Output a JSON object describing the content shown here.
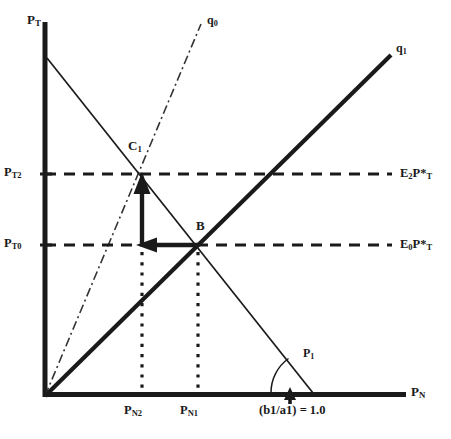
{
  "figure": {
    "type": "economics-diagram",
    "axes": {
      "y_axis_label": "P",
      "y_axis_sub": "T",
      "x_axis_label": "P",
      "x_axis_sub": "N"
    },
    "y_ticks": [
      {
        "label": "P",
        "sub": "T2",
        "y": 174
      },
      {
        "label": "P",
        "sub": "T0",
        "y": 245
      }
    ],
    "x_ticks": [
      {
        "label": "P",
        "sub": "N2",
        "x": 142
      },
      {
        "label": "P",
        "sub": "N1",
        "x": 198
      }
    ],
    "right_labels": [
      {
        "prefix": "E",
        "sub1": "2",
        "mid": "P*",
        "sub2": "T",
        "y": 174
      },
      {
        "prefix": "E",
        "sub1": "0",
        "mid": "P*",
        "sub2": "T",
        "y": 245
      }
    ],
    "curves": [
      {
        "name": "q0",
        "label": "q",
        "sub": "0",
        "style": "dash-dot"
      },
      {
        "name": "q1",
        "label": "q",
        "sub": "1",
        "style": "solid-thick"
      },
      {
        "name": "P1",
        "label": "P",
        "sub": "1",
        "style": "solid-thin"
      }
    ],
    "points": [
      {
        "name": "C1",
        "label": "C",
        "sub": "1",
        "x": 142,
        "y": 174
      },
      {
        "name": "B",
        "label": "B",
        "sub": "",
        "x": 198,
        "y": 245
      }
    ],
    "annotation": {
      "slope_note": "(b1/a1) = 1.0"
    },
    "colors": {
      "line": "#1a1a1a",
      "text": "#1a1a1a",
      "background": "#ffffff"
    }
  }
}
